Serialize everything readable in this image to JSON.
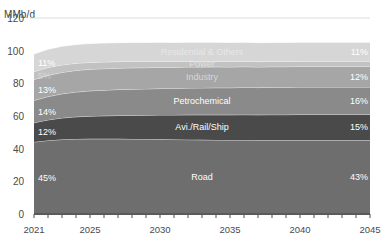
{
  "chart_data": {
    "type": "area",
    "title": "",
    "subtitle": "",
    "ylabel": "MMb/d",
    "xlabel": "",
    "ylim": [
      0,
      120
    ],
    "yticks": [
      0,
      20,
      40,
      60,
      80,
      100,
      120
    ],
    "xlim": [
      2021,
      2045
    ],
    "xticks": [
      2021,
      2025,
      2030,
      2035,
      2040,
      2045
    ],
    "x": [
      2021,
      2022,
      2023,
      2024,
      2025,
      2026,
      2027,
      2028,
      2029,
      2030,
      2031,
      2032,
      2033,
      2034,
      2035,
      2036,
      2037,
      2038,
      2039,
      2040,
      2041,
      2042,
      2043,
      2044,
      2045
    ],
    "grid": "horizontal-top-only",
    "stacked": true,
    "legend": "inline-band-labels",
    "series": [
      {
        "name": "Road",
        "color": "#6e6e6e",
        "start_pct": "45%",
        "end_pct": "43%",
        "values": [
          44.1,
          45.0,
          45.6,
          45.9,
          46.0,
          46.0,
          46.0,
          45.9,
          45.8,
          45.7,
          45.6,
          45.5,
          45.4,
          45.3,
          45.2,
          45.2,
          45.1,
          45.1,
          45.1,
          45.1,
          45.1,
          45.1,
          45.1,
          45.1,
          45.1
        ]
      },
      {
        "name": "Avi./Rail/Ship",
        "color": "#4a4a4a",
        "start_pct": "12%",
        "end_pct": "15%",
        "values": [
          11.8,
          12.6,
          13.2,
          13.6,
          13.9,
          14.1,
          14.3,
          14.5,
          14.7,
          14.9,
          15.0,
          15.2,
          15.3,
          15.4,
          15.5,
          15.6,
          15.6,
          15.7,
          15.7,
          15.8,
          15.8,
          15.8,
          15.8,
          15.8,
          15.8
        ]
      },
      {
        "name": "Petrochemical",
        "color": "#8a8a8a",
        "start_pct": "14%",
        "end_pct": "16%",
        "values": [
          13.7,
          14.3,
          14.8,
          15.2,
          15.5,
          15.7,
          15.9,
          16.0,
          16.1,
          16.2,
          16.3,
          16.4,
          16.5,
          16.6,
          16.6,
          16.7,
          16.7,
          16.8,
          16.8,
          16.8,
          16.8,
          16.8,
          16.8,
          16.8,
          16.8
        ]
      },
      {
        "name": "Industry",
        "color": "#a6a6a6",
        "start_pct": "13%",
        "end_pct": "12%",
        "values": [
          12.7,
          13.0,
          13.1,
          13.2,
          13.2,
          13.2,
          13.1,
          13.1,
          13.0,
          13.0,
          12.9,
          12.9,
          12.8,
          12.8,
          12.7,
          12.7,
          12.6,
          12.6,
          12.6,
          12.6,
          12.6,
          12.6,
          12.6,
          12.6,
          12.6
        ]
      },
      {
        "name": "Power",
        "color": "#c2c2c2",
        "start_pct": "5%",
        "end_pct": "3%",
        "values": [
          4.9,
          4.8,
          4.6,
          4.4,
          4.2,
          4.1,
          4.0,
          3.9,
          3.8,
          3.7,
          3.6,
          3.5,
          3.5,
          3.4,
          3.4,
          3.3,
          3.3,
          3.2,
          3.2,
          3.2,
          3.2,
          3.2,
          3.2,
          3.2,
          3.2
        ]
      },
      {
        "name": "Residential & Others",
        "color": "#d6d6d6",
        "start_pct": "11%",
        "end_pct": "11%",
        "values": [
          10.8,
          11.2,
          11.4,
          11.5,
          11.6,
          11.6,
          11.6,
          11.6,
          11.6,
          11.6,
          11.6,
          11.6,
          11.6,
          11.6,
          11.6,
          11.6,
          11.6,
          11.6,
          11.6,
          11.6,
          11.6,
          11.6,
          11.6,
          11.6,
          11.6
        ]
      }
    ],
    "totals": [
      98.0,
      100.9,
      102.7,
      103.8,
      104.4,
      104.7,
      104.9,
      105.0,
      105.0,
      105.1,
      105.0,
      105.1,
      105.1,
      105.1,
      105.0,
      105.1,
      104.9,
      105.0,
      105.0,
      105.1,
      105.1,
      105.1,
      105.1,
      105.1,
      105.1
    ]
  },
  "axis": {
    "unit": "MMb/d",
    "baseline_color": "#5a5a5a",
    "gridline_color": "#dcdcdc"
  }
}
